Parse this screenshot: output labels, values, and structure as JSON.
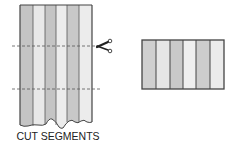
{
  "caption": "CUT SEGMENTS",
  "strip": {
    "band_colors": [
      "#c4c4c4",
      "#e8e8e8",
      "#c4c4c4",
      "#ececec",
      "#c8c8c8",
      "#ececec"
    ],
    "outline_color": "#444444"
  },
  "segment": {
    "band_colors": [
      "#cfcfcf",
      "#e6e6e6",
      "#c9c9c9",
      "#efefef",
      "#cdcdcd",
      "#ebebeb"
    ],
    "outline_color": "#444444"
  },
  "cut_lines": {
    "count": 2,
    "style": "dashed"
  },
  "icons": {
    "scissors": "scissors-icon"
  }
}
